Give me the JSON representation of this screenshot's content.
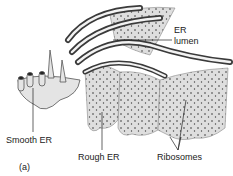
{
  "diagram": {
    "panel_label": "(a)",
    "labels": {
      "er_lumen_line1": "ER",
      "er_lumen_line2": "lumen",
      "smooth_er": "Smooth ER",
      "rough_er": "Rough ER",
      "ribosomes": "Ribosomes"
    },
    "colors": {
      "membrane_fill": "#d9d9d9",
      "membrane_dark": "#3a3a3a",
      "lumen_light": "#f2f2f2",
      "ribosome_dot": "#333333",
      "label_text": "#222222"
    }
  }
}
